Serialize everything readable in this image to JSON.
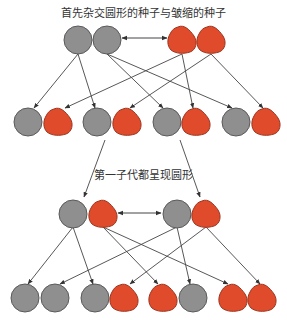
{
  "titles": {
    "top": "首先杂交圆形的种子与皱缩的种子",
    "middle": "第一子代都呈现圆形"
  },
  "colors": {
    "round_fill": "#8f8f8f",
    "round_stroke": "#5a5a5a",
    "wrinkled_fill": "#e04b2b",
    "wrinkled_stroke": "#9b3520",
    "line": "#444444"
  },
  "seed_types": {
    "round": "round-seed (gray circle)",
    "wrinkled": "wrinkled-seed (red)"
  },
  "rows": {
    "parents": [
      {
        "type": "round",
        "x": 78,
        "y": 40
      },
      {
        "type": "round",
        "x": 107,
        "y": 40
      },
      {
        "type": "wrinkled",
        "x": 182,
        "y": 40
      },
      {
        "type": "wrinkled",
        "x": 211,
        "y": 40
      }
    ],
    "f1_gametes": [
      {
        "type": "round",
        "x": 28,
        "y": 122
      },
      {
        "type": "wrinkled",
        "x": 58,
        "y": 122
      },
      {
        "type": "round",
        "x": 97,
        "y": 122
      },
      {
        "type": "wrinkled",
        "x": 127,
        "y": 122
      },
      {
        "type": "round",
        "x": 167,
        "y": 122
      },
      {
        "type": "wrinkled",
        "x": 196,
        "y": 122
      },
      {
        "type": "round",
        "x": 236,
        "y": 122
      },
      {
        "type": "wrinkled",
        "x": 266,
        "y": 122
      }
    ],
    "f1_cross": [
      {
        "type": "round",
        "x": 73,
        "y": 214
      },
      {
        "type": "wrinkled",
        "x": 103,
        "y": 214
      },
      {
        "type": "round",
        "x": 177,
        "y": 214
      },
      {
        "type": "wrinkled",
        "x": 206,
        "y": 214
      }
    ],
    "f2": [
      {
        "type": "round",
        "x": 25,
        "y": 298
      },
      {
        "type": "round",
        "x": 55,
        "y": 298
      },
      {
        "type": "round",
        "x": 95,
        "y": 298
      },
      {
        "type": "wrinkled",
        "x": 124,
        "y": 298
      },
      {
        "type": "wrinkled",
        "x": 163,
        "y": 298
      },
      {
        "type": "round",
        "x": 193,
        "y": 298
      },
      {
        "type": "wrinkled",
        "x": 233,
        "y": 298
      },
      {
        "type": "wrinkled",
        "x": 262,
        "y": 298
      }
    ]
  },
  "arrows": [
    {
      "x1": 78,
      "y1": 54,
      "x2": 34,
      "y2": 108
    },
    {
      "x1": 78,
      "y1": 54,
      "x2": 95,
      "y2": 108
    },
    {
      "x1": 107,
      "y1": 54,
      "x2": 163,
      "y2": 108
    },
    {
      "x1": 107,
      "y1": 54,
      "x2": 232,
      "y2": 108
    },
    {
      "x1": 182,
      "y1": 54,
      "x2": 65,
      "y2": 108
    },
    {
      "x1": 182,
      "y1": 54,
      "x2": 193,
      "y2": 108
    },
    {
      "x1": 211,
      "y1": 54,
      "x2": 130,
      "y2": 108
    },
    {
      "x1": 211,
      "y1": 54,
      "x2": 263,
      "y2": 108
    },
    {
      "x1": 105,
      "y1": 140,
      "x2": 84,
      "y2": 197
    },
    {
      "x1": 180,
      "y1": 140,
      "x2": 200,
      "y2": 197
    },
    {
      "x1": 73,
      "y1": 227,
      "x2": 28,
      "y2": 284
    },
    {
      "x1": 73,
      "y1": 227,
      "x2": 93,
      "y2": 284
    },
    {
      "x1": 103,
      "y1": 227,
      "x2": 158,
      "y2": 284
    },
    {
      "x1": 103,
      "y1": 227,
      "x2": 228,
      "y2": 284
    },
    {
      "x1": 177,
      "y1": 227,
      "x2": 60,
      "y2": 284
    },
    {
      "x1": 177,
      "y1": 227,
      "x2": 190,
      "y2": 284
    },
    {
      "x1": 206,
      "y1": 227,
      "x2": 130,
      "y2": 284
    },
    {
      "x1": 206,
      "y1": 227,
      "x2": 260,
      "y2": 284
    }
  ],
  "cross_arrows": [
    {
      "x1": 122,
      "y1": 38,
      "x2": 167,
      "y2": 38
    },
    {
      "x1": 118,
      "y1": 213,
      "x2": 161,
      "y2": 213
    }
  ]
}
